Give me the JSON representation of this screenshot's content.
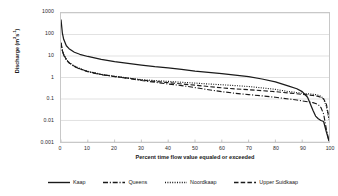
{
  "chart_data": {
    "type": "line",
    "title": "",
    "xlabel": "Percent time flow value equaled or exceeded",
    "ylabel": "Discharge (m3s-1)",
    "ylabel_html": "Discharge (m<sup>3</sup>s<sup>-1</sup>)",
    "yscale": "log",
    "ylim": [
      0.001,
      1000
    ],
    "xlim": [
      0,
      100
    ],
    "grid": "horizontal",
    "legend_position": "bottom",
    "y_ticks": [
      "1000",
      "100",
      "10",
      "1",
      "0.1",
      "0.01",
      "0.001"
    ],
    "y_tick_values": [
      1000,
      100,
      10,
      1,
      0.1,
      0.01,
      0.001
    ],
    "x_ticks": [
      "0",
      "10",
      "20",
      "30",
      "40",
      "50",
      "60",
      "70",
      "80",
      "90",
      "100"
    ],
    "x_tick_values": [
      0,
      10,
      20,
      30,
      40,
      50,
      60,
      70,
      80,
      90,
      100
    ],
    "x": [
      0,
      0.5,
      1,
      2,
      3,
      5,
      7,
      10,
      15,
      20,
      25,
      30,
      35,
      40,
      45,
      50,
      55,
      60,
      65,
      70,
      75,
      80,
      85,
      88,
      90,
      92,
      94,
      95,
      96,
      97,
      98,
      99,
      100
    ],
    "series": [
      {
        "name": "Kaap",
        "style": "solid",
        "color": "#1a1a1a",
        "values": [
          500,
          120,
          60,
          30,
          22,
          15,
          12,
          9.5,
          7.0,
          5.5,
          4.5,
          3.8,
          3.2,
          2.8,
          2.4,
          2.0,
          1.75,
          1.5,
          1.3,
          1.1,
          0.85,
          0.62,
          0.4,
          0.3,
          0.22,
          0.12,
          0.03,
          0.016,
          0.012,
          0.01,
          0.009,
          0.003,
          0.0011
        ]
      },
      {
        "name": "Queens",
        "style": "dash-dot",
        "color": "#1a1a1a",
        "values": [
          40,
          18,
          11,
          6.5,
          4.8,
          3.2,
          2.5,
          1.85,
          1.35,
          1.1,
          0.92,
          0.72,
          0.6,
          0.5,
          0.42,
          0.34,
          0.27,
          0.22,
          0.185,
          0.16,
          0.14,
          0.12,
          0.1,
          0.09,
          0.082,
          0.075,
          0.068,
          0.062,
          0.055,
          0.04,
          0.02,
          0.004,
          0.0011
        ]
      },
      {
        "name": "Noordkaap",
        "style": "dotted",
        "color": "#1a1a1a",
        "values": [
          42,
          19,
          12,
          7.0,
          5.0,
          3.4,
          2.6,
          1.95,
          1.4,
          1.15,
          0.95,
          0.8,
          0.72,
          0.66,
          0.6,
          0.55,
          0.5,
          0.46,
          0.42,
          0.38,
          0.33,
          0.28,
          0.22,
          0.2,
          0.185,
          0.175,
          0.165,
          0.16,
          0.15,
          0.135,
          0.1,
          0.045,
          0.011
        ]
      },
      {
        "name": "Upper Suidkaap",
        "style": "dashed",
        "color": "#1a1a1a",
        "values": [
          40,
          18,
          11.5,
          6.8,
          4.9,
          3.3,
          2.55,
          1.9,
          1.38,
          1.12,
          0.93,
          0.76,
          0.66,
          0.58,
          0.5,
          0.44,
          0.38,
          0.33,
          0.295,
          0.27,
          0.245,
          0.22,
          0.19,
          0.175,
          0.165,
          0.155,
          0.145,
          0.14,
          0.132,
          0.12,
          0.1,
          0.06,
          0.013
        ]
      }
    ]
  },
  "legend": {
    "items": [
      {
        "label": "Kaap",
        "style": "solid"
      },
      {
        "label": "Queens",
        "style": "dash-dot"
      },
      {
        "label": "Noordkaap",
        "style": "dotted"
      },
      {
        "label": "Upper Suidkaap",
        "style": "dashed"
      }
    ]
  }
}
